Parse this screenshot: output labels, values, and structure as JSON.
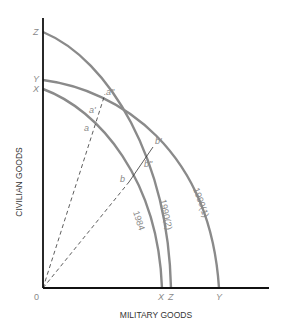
{
  "diagram": {
    "type": "production-possibilities-frontier",
    "x_axis_label": "MILITARY GOODS",
    "y_axis_label": "CIVILIAN GOODS",
    "origin_label": "0",
    "y_intercepts": {
      "Z": "Z",
      "Y": "Y",
      "X": "X"
    },
    "x_intercepts": {
      "X": "X",
      "Z": "Z",
      "Y": "Y"
    },
    "curves": [
      {
        "name": "1984",
        "label": "1984",
        "from": "X",
        "to": "X"
      },
      {
        "name": "1990(2)",
        "label": "1990(2)",
        "from": "Z",
        "to": "Z"
      },
      {
        "name": "1990(1)",
        "label": "1990(1)",
        "from": "Y",
        "to": "Y"
      }
    ],
    "points": {
      "a": "a",
      "a_prime": "a'",
      "a_double_prime": "a\"",
      "b": "b",
      "b_prime": "b'",
      "b_double_prime": "b\""
    },
    "rays": [
      "0 through a, a', a\"",
      "0 through b, b\", b'"
    ]
  }
}
